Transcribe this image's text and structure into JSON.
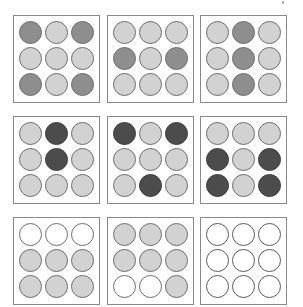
{
  "puzzle": {
    "type": "3x3 matrix reasoning",
    "colors": {
      "light": "#d2d2d2",
      "mid": "#8e8e8e",
      "midlight": "#a6a6a6",
      "dark": "#4c4c4c",
      "empty": "#ffffff",
      "border": "#6e6e6e",
      "panel_border": "#8a8a8a"
    },
    "panels": [
      {
        "row": 0,
        "col": 0,
        "x": 13,
        "y": 15,
        "cells": [
          "mid",
          "light",
          "mid",
          "light",
          "light",
          "light",
          "mid",
          "light",
          "mid"
        ]
      },
      {
        "row": 0,
        "col": 1,
        "x": 107,
        "y": 15,
        "cells": [
          "light",
          "light",
          "light",
          "mid",
          "light",
          "mid",
          "light",
          "light",
          "light"
        ]
      },
      {
        "row": 0,
        "col": 2,
        "x": 200,
        "y": 15,
        "cells": [
          "light",
          "mid",
          "light",
          "light",
          "mid",
          "light",
          "light",
          "mid",
          "light"
        ]
      },
      {
        "row": 1,
        "col": 0,
        "x": 13,
        "y": 116,
        "cells": [
          "light",
          "dark",
          "light",
          "light",
          "dark",
          "light",
          "light",
          "light",
          "light"
        ]
      },
      {
        "row": 1,
        "col": 1,
        "x": 107,
        "y": 116,
        "cells": [
          "dark",
          "light",
          "dark",
          "light",
          "light",
          "light",
          "light",
          "dark",
          "light"
        ]
      },
      {
        "row": 1,
        "col": 2,
        "x": 200,
        "y": 116,
        "cells": [
          "light",
          "light",
          "light",
          "dark",
          "light",
          "dark",
          "dark",
          "light",
          "dark"
        ]
      },
      {
        "row": 2,
        "col": 0,
        "x": 13,
        "y": 217,
        "cells": [
          "midlight",
          "midlight",
          "midlight",
          "light",
          "light",
          "light",
          "light",
          "light",
          "light"
        ]
      },
      {
        "row": 2,
        "col": 1,
        "x": 107,
        "y": 217,
        "cells": [
          "light",
          "light",
          "light",
          "light",
          "light",
          "light",
          "midlight",
          "midlight",
          "light"
        ]
      },
      {
        "row": 2,
        "col": 2,
        "x": 200,
        "y": 217,
        "cells": [
          "empty",
          "empty",
          "empty",
          "empty",
          "empty",
          "empty",
          "empty",
          "empty",
          "empty"
        ],
        "is_answer_slot": true
      }
    ],
    "circle": {
      "diameter": 23,
      "pitch": 26,
      "offset_x": 6,
      "offset_y": 6
    }
  }
}
